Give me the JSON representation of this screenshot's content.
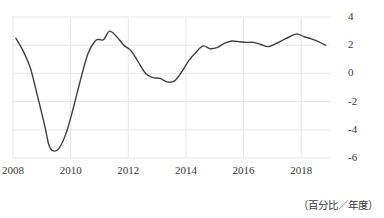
{
  "chart_data": {
    "type": "line",
    "title": "",
    "subtitle": "",
    "xlabel": "",
    "ylabel": "",
    "unit_note": "（百分比／年度）",
    "xlim": [
      2008.0,
      2019.0
    ],
    "ylim": [
      -6,
      4
    ],
    "grid": true,
    "legend": null,
    "line_color": "#404040",
    "grid_color": "#e8e8e8",
    "axis_text_color": "#3a3a3a",
    "yticks": [
      4,
      2,
      0,
      -2,
      -4,
      -6
    ],
    "ytick_labels": [
      "4",
      "2",
      "0",
      "-2",
      "-4",
      "-6"
    ],
    "xticks": [
      2008,
      2010,
      2012,
      2014,
      2016,
      2018
    ],
    "xtick_labels": [
      "2008",
      "2010",
      "2012",
      "2014",
      "2016",
      "2018"
    ],
    "series": [
      {
        "name": "growth-rate",
        "x": [
          2008.1,
          2008.35,
          2008.6,
          2008.85,
          2009.1,
          2009.25,
          2009.4,
          2009.6,
          2009.85,
          2010.1,
          2010.35,
          2010.6,
          2010.85,
          2011.0,
          2011.15,
          2011.35,
          2011.6,
          2011.85,
          2012.1,
          2012.35,
          2012.6,
          2012.85,
          2013.1,
          2013.35,
          2013.6,
          2013.85,
          2014.1,
          2014.35,
          2014.6,
          2014.85,
          2015.1,
          2015.35,
          2015.6,
          2015.85,
          2016.1,
          2016.35,
          2016.6,
          2016.85,
          2017.1,
          2017.35,
          2017.6,
          2017.85,
          2018.1,
          2018.35,
          2018.6,
          2018.85
        ],
        "y": [
          2.5,
          1.6,
          0.4,
          -1.6,
          -3.7,
          -5.1,
          -5.5,
          -5.3,
          -4.2,
          -2.4,
          -0.4,
          1.4,
          2.3,
          2.4,
          2.4,
          3.0,
          2.6,
          2.0,
          1.6,
          0.8,
          0.0,
          -0.3,
          -0.35,
          -0.6,
          -0.55,
          0.1,
          0.9,
          1.5,
          1.95,
          1.75,
          1.85,
          2.15,
          2.3,
          2.25,
          2.2,
          2.2,
          2.05,
          1.9,
          2.1,
          2.35,
          2.6,
          2.8,
          2.6,
          2.45,
          2.25,
          2.0
        ]
      }
    ]
  },
  "axes": {
    "plot_left_px": 13,
    "plot_right_px": 330,
    "plot_top_px": 17,
    "plot_bottom_px": 158
  }
}
